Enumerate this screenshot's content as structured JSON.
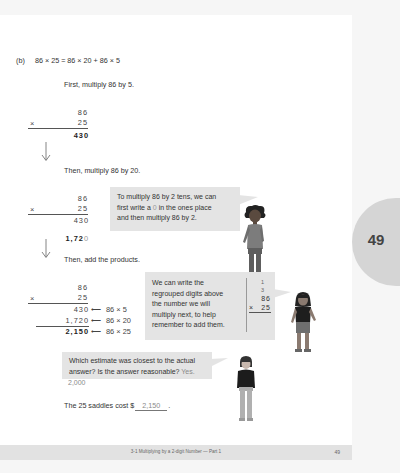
{
  "problem": {
    "label": "(b)",
    "equation": "86 × 25 = 86 × 20 + 86 × 5"
  },
  "steps": {
    "step1_text": "First, multiply 86 by 5.",
    "step2_text": "Then, multiply 86 by 20.",
    "step3_text": "Then, add the products."
  },
  "work1": {
    "top": "86",
    "mult_sign": "×",
    "bottom": "25",
    "product": "430"
  },
  "work2": {
    "top": "86",
    "mult_sign": "×",
    "bottom": "25",
    "partial1": "430",
    "partial2_main": "1,72",
    "partial2_zero": "0"
  },
  "work3": {
    "top": "86",
    "mult_sign": "×",
    "bottom": "25",
    "rows": [
      {
        "value": "430",
        "arrow": "⟵",
        "note": "86 × 5"
      },
      {
        "value": "1,720",
        "arrow": "⟵",
        "note": "86 × 20"
      },
      {
        "value": "2,150",
        "arrow": "⟵",
        "note": "86 × 25"
      }
    ]
  },
  "bubbles": {
    "tens_tip": "To multiply 86 by 2 tens, we can first write a 0 in the ones place and then multiply 86 by 2.",
    "tens_tip_lines": [
      "To multiply 86 by 2 tens, we can",
      "first write a ",
      "0",
      " in the ones place",
      "and then multiply 86 by 2."
    ],
    "regroup_tip_lines": [
      "We can write the",
      "regrouped digits above",
      "the number we will",
      "multiply next, to help",
      "remember to add them."
    ],
    "regroup_example": {
      "carry1": "1",
      "carry2": "3",
      "top": "86",
      "mult_sign": "×",
      "bottom": "25"
    },
    "estimate_question_lines": [
      "Which estimate was closest to the actual",
      "answer? Is the answer reasonable?"
    ],
    "estimate_answer_inline": "Yes.",
    "estimate_answer_value": "2,000"
  },
  "conclusion": {
    "prefix": "The 25 saddles cost $",
    "answer": "2,150",
    "suffix": "."
  },
  "side_tab": {
    "page_number": "49"
  },
  "footer": {
    "chapter_title": "3-1  Multiplying by a 2-digit Number — Part 1",
    "page_number": "49"
  },
  "colors": {
    "bubble_bg": "#e4e4e4",
    "tab_bg": "#d5d5d5",
    "footer_bg": "#e2e2e2",
    "answer_text": "#8a8a8a"
  }
}
